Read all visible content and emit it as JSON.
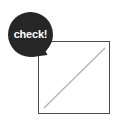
{
  "canvas": {
    "width": 117,
    "height": 125,
    "background_color": "#ffffff"
  },
  "speech_bubble": {
    "label": "check!",
    "fill_color": "#262626",
    "text_color": "#ffffff",
    "shape": "circle",
    "tail_direction": "down-right"
  },
  "frame": {
    "shape": "square",
    "border_color": "#4a4a4a",
    "fill_color": "#ffffff"
  },
  "diagonal": {
    "stroke_color": "#b0b0b0",
    "direction": "bottom-left-to-top-right",
    "x1": 44,
    "y1": 108,
    "x2": 105,
    "y2": 48
  }
}
